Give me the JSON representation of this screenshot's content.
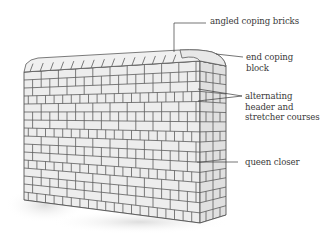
{
  "diagram": {
    "colors": {
      "line": "#5a5a5a",
      "brick_fill": "#ececec",
      "shade": "#d4d4d4",
      "text": "#3a3a3a",
      "background": "#ffffff"
    },
    "labels": [
      {
        "id": "angled-coping",
        "lines": [
          "angled coping bricks"
        ]
      },
      {
        "id": "end-coping",
        "lines": [
          "end coping",
          "block"
        ]
      },
      {
        "id": "alternating-courses",
        "lines": [
          "alternating",
          "header and",
          "stretcher courses"
        ]
      },
      {
        "id": "queen-closer",
        "lines": [
          "queen closer"
        ]
      }
    ]
  }
}
